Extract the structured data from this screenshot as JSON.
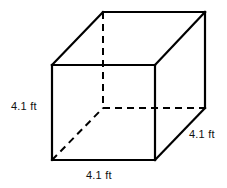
{
  "figure": {
    "kind": "cube-wireframe-diagram",
    "background_color": "#ffffff",
    "stroke_color": "#000000",
    "text_color": "#111111",
    "solid_stroke_width": 2.2,
    "hidden_stroke_width": 2.0,
    "hidden_dash_pattern": "7 5"
  },
  "labels": {
    "height": "4.1 ft",
    "width": "4.1 ft",
    "depth": "4.1 ft"
  },
  "geometry": {
    "front_face": {
      "top_left": [
        52,
        65
      ],
      "top_right": [
        155,
        65
      ],
      "bottom_right": [
        155,
        160
      ],
      "bottom_left": [
        52,
        160
      ]
    },
    "back_face": {
      "top_left": [
        103,
        12
      ],
      "top_right": [
        205,
        12
      ],
      "bottom_right": [
        205,
        108
      ],
      "bottom_left": [
        103,
        108
      ]
    },
    "hidden_vertex": [
      103,
      108
    ],
    "depth_offset": [
      51,
      -53
    ]
  }
}
